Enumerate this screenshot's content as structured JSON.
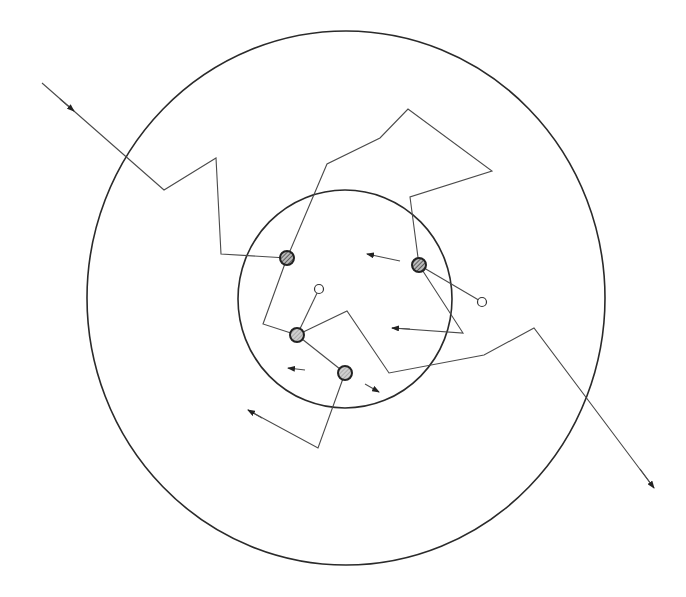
{
  "diagram": {
    "title": "",
    "colors": {
      "background": "#ffffff",
      "stroke": "#2a2a2a",
      "path": "#4a4a4a",
      "particle_fill": "#8a8a8a",
      "particle_dark_fill": "#555555"
    },
    "circles": [
      {
        "name": "outer-circle",
        "cx": 346,
        "cy": 298,
        "rx": 259,
        "ry": 267
      },
      {
        "name": "inner-circle",
        "cx": 345,
        "cy": 299,
        "rx": 107,
        "ry": 109
      }
    ],
    "paths": [
      {
        "name": "incoming-track",
        "points": [
          [
            42,
            83
          ],
          [
            164,
            190
          ],
          [
            216,
            158
          ],
          [
            221,
            254
          ],
          [
            287,
            258
          ]
        ]
      },
      {
        "name": "track-particle1-up",
        "points": [
          [
            287,
            258
          ],
          [
            327,
            164
          ],
          [
            380,
            138
          ],
          [
            408,
            109
          ],
          [
            492,
            171
          ],
          [
            410,
            197
          ],
          [
            419,
            265
          ]
        ]
      },
      {
        "name": "track-particle1-down",
        "points": [
          [
            287,
            258
          ],
          [
            263,
            324
          ],
          [
            297,
            335
          ]
        ]
      },
      {
        "name": "track-A-to-B",
        "points": [
          [
            297,
            335
          ],
          [
            345,
            373
          ]
        ]
      },
      {
        "name": "outgoing-track",
        "points": [
          [
            297,
            335
          ],
          [
            347,
            311
          ],
          [
            389,
            373
          ],
          [
            484,
            355
          ],
          [
            534,
            328
          ],
          [
            654,
            488
          ]
        ]
      },
      {
        "name": "track-C-vertex",
        "points": [
          [
            419,
            265
          ],
          [
            463,
            333
          ],
          [
            392,
            328
          ]
        ]
      },
      {
        "name": "track-B-down",
        "points": [
          [
            345,
            373
          ],
          [
            318,
            448
          ],
          [
            248,
            410
          ]
        ]
      }
    ],
    "arrows": [
      {
        "name": "incoming-arrow",
        "x1": 60,
        "y1": 99,
        "x2": 74,
        "y2": 111
      },
      {
        "name": "outgoing-arrow",
        "x1": 640,
        "y1": 469,
        "x2": 654,
        "y2": 488
      },
      {
        "name": "arrow-from-C-left",
        "x1": 400,
        "y1": 261,
        "x2": 367,
        "y2": 254
      },
      {
        "name": "arrow-C-vertex-left",
        "x1": 410,
        "y1": 329,
        "x2": 392,
        "y2": 328
      },
      {
        "name": "arrow-B-left",
        "x1": 305,
        "y1": 370,
        "x2": 288,
        "y2": 368
      },
      {
        "name": "arrow-B-right",
        "x1": 365,
        "y1": 384,
        "x2": 379,
        "y2": 392
      },
      {
        "name": "arrow-B-down-left",
        "x1": 262,
        "y1": 418,
        "x2": 248,
        "y2": 410
      }
    ],
    "particles": [
      {
        "name": "particle-1",
        "cx": 287,
        "cy": 258,
        "r": 7,
        "style": "dark"
      },
      {
        "name": "particle-C",
        "cx": 419,
        "cy": 265,
        "r": 7,
        "style": "dark"
      },
      {
        "name": "particle-A",
        "cx": 297,
        "cy": 335,
        "r": 7,
        "style": "light"
      },
      {
        "name": "particle-B",
        "cx": 345,
        "cy": 373,
        "r": 7,
        "style": "light"
      }
    ],
    "open_particles": [
      {
        "name": "open-particle-1",
        "cx": 319,
        "cy": 289,
        "r": 4.5,
        "from": [
          297,
          335
        ]
      },
      {
        "name": "open-particle-2",
        "cx": 482,
        "cy": 302,
        "r": 4.5,
        "from": [
          419,
          265
        ]
      }
    ]
  }
}
